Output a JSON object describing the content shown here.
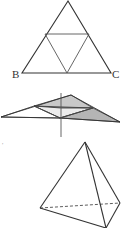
{
  "figure1": {
    "label_b": "B",
    "label_c": "C",
    "outer": [
      [
        68,
        1
      ],
      [
        22,
        73
      ],
      [
        111,
        73
      ]
    ],
    "inner": [
      [
        45,
        34
      ],
      [
        89,
        34
      ],
      [
        67,
        73
      ]
    ]
  },
  "figure2": {
    "outer": [
      [
        1,
        117
      ],
      [
        71,
        95
      ],
      [
        120,
        122
      ],
      [
        60,
        118
      ]
    ],
    "axis": [
      [
        61,
        93
      ],
      [
        61,
        137
      ]
    ]
  },
  "figure3": {
    "mark": "'",
    "apex": [
      85,
      142
    ],
    "left": [
      40,
      208
    ],
    "back": [
      120,
      203
    ],
    "front": [
      106,
      228
    ]
  },
  "colors": {
    "line": "#333333",
    "shade_light": "#e6e6e6",
    "shade_dark": "#bdbdbd"
  }
}
